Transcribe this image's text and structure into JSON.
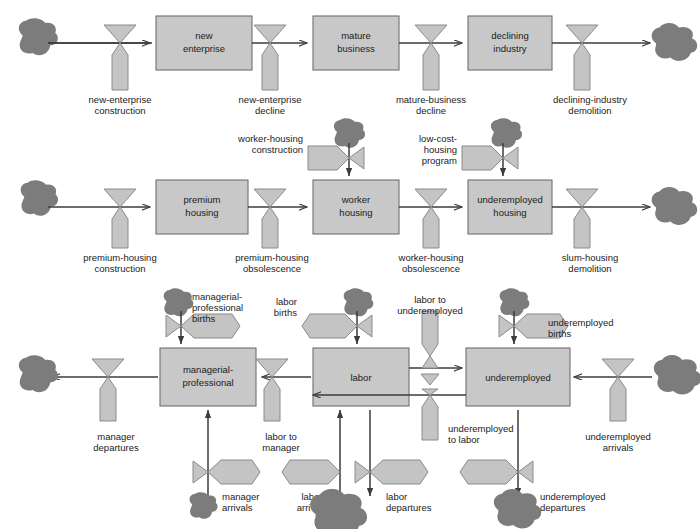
{
  "diagram": {
    "colors": {
      "stock_fill": "#c8c8c8",
      "stock_stroke": "#6f6f6f",
      "valve_fill": "#c4c4c4",
      "valve_stroke": "#8a8a8a",
      "cloud_fill": "#7c7c7c",
      "arrow": "#3c3c3c",
      "text": "#1b1b1b",
      "background": "#ffffff"
    },
    "sectors": [
      {
        "id": "business",
        "name": "business sector"
      },
      {
        "id": "housing",
        "name": "housing sector"
      },
      {
        "id": "population",
        "name": "population sector"
      }
    ],
    "stocks": [
      {
        "id": "new-enterprise",
        "label": "new\nenterprise",
        "line1": "new",
        "line2": "enterprise",
        "sector": "business"
      },
      {
        "id": "mature-business",
        "label": "mature\nbusiness",
        "line1": "mature",
        "line2": "business",
        "sector": "business"
      },
      {
        "id": "declining-industry",
        "label": "declining\nindustry",
        "line1": "declining",
        "line2": "industry",
        "sector": "business"
      },
      {
        "id": "premium-housing",
        "label": "premium\nhousing",
        "line1": "premium",
        "line2": "housing",
        "sector": "housing"
      },
      {
        "id": "worker-housing",
        "label": "worker\nhousing",
        "line1": "worker",
        "line2": "housing",
        "sector": "housing"
      },
      {
        "id": "underemployed-housing",
        "label": "underemployed\nhousing",
        "line1": "underemployed",
        "line2": "housing",
        "sector": "housing"
      },
      {
        "id": "managerial-professional",
        "label": "managerial-\nprofessional",
        "line1": "managerial-",
        "line2": "professional",
        "sector": "population"
      },
      {
        "id": "labor",
        "label": "labor",
        "line1": "labor",
        "line2": "",
        "sector": "population"
      },
      {
        "id": "underemployed",
        "label": "underemployed",
        "line1": "underemployed",
        "line2": "",
        "sector": "population"
      }
    ],
    "flows": [
      {
        "id": "new-enterprise-construction",
        "line1": "new-enterprise",
        "line2": "construction",
        "sector": "business"
      },
      {
        "id": "new-enterprise-decline",
        "line1": "new-enterprise",
        "line2": "decline",
        "sector": "business"
      },
      {
        "id": "mature-business-decline",
        "line1": "mature-business",
        "line2": "decline",
        "sector": "business"
      },
      {
        "id": "declining-industry-demolition",
        "line1": "declining-industry",
        "line2": "demolition",
        "sector": "business"
      },
      {
        "id": "premium-housing-construction",
        "line1": "premium-housing",
        "line2": "construction",
        "sector": "housing"
      },
      {
        "id": "premium-housing-obsolescence",
        "line1": "premium-housing",
        "line2": "obsolescence",
        "sector": "housing"
      },
      {
        "id": "worker-housing-obsolescence",
        "line1": "worker-housing",
        "line2": "obsolescence",
        "sector": "housing"
      },
      {
        "id": "slum-housing-demolition",
        "line1": "slum-housing",
        "line2": "demolition",
        "sector": "housing"
      },
      {
        "id": "worker-housing-construction",
        "line1": "worker-housing",
        "line2": "construction",
        "sector": "housing"
      },
      {
        "id": "low-cost-housing-program",
        "line1": "low-cost-",
        "line2": "housing",
        "line3": "program",
        "sector": "housing"
      },
      {
        "id": "managerial-professional-births",
        "line1": "managerial-",
        "line2": "professional",
        "line3": "births",
        "sector": "population"
      },
      {
        "id": "manager-departures",
        "line1": "manager",
        "line2": "departures",
        "sector": "population"
      },
      {
        "id": "manager-arrivals",
        "line1": "manager",
        "line2": "arrivals",
        "sector": "population"
      },
      {
        "id": "labor-births",
        "line1": "labor",
        "line2": "births",
        "sector": "population"
      },
      {
        "id": "labor-to-manager",
        "line1": "labor to",
        "line2": "manager",
        "sector": "population"
      },
      {
        "id": "labor-arrivals",
        "line1": "labor",
        "line2": "arrivals",
        "sector": "population"
      },
      {
        "id": "labor-departures",
        "line1": "labor",
        "line2": "departures",
        "sector": "population"
      },
      {
        "id": "labor-to-underemployed",
        "line1": "labor to",
        "line2": "underemployed",
        "sector": "population"
      },
      {
        "id": "underemployed-to-labor",
        "line1": "underemployed",
        "line2": "to labor",
        "sector": "population"
      },
      {
        "id": "underemployed-births",
        "line1": "underemployed",
        "line2": "births",
        "sector": "population"
      },
      {
        "id": "underemployed-arrivals",
        "line1": "underemployed",
        "line2": "arrivals",
        "sector": "population"
      },
      {
        "id": "underemployed-departures",
        "line1": "underemployed",
        "line2": "departures",
        "sector": "population"
      }
    ]
  }
}
